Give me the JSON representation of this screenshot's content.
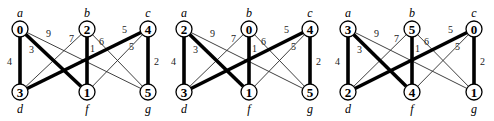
{
  "colors": {
    "background": "#ffffff",
    "edge": "#000000",
    "node_fill": "#ffffff"
  },
  "edges": [
    {
      "from": "a",
      "to": "d",
      "weight": "4",
      "thick": true,
      "label_offset": [
        -9,
        0
      ]
    },
    {
      "from": "a",
      "to": "f",
      "weight": "3",
      "thick": true,
      "label_offset": [
        -20,
        -16
      ]
    },
    {
      "from": "a",
      "to": "g",
      "weight": "9",
      "thick": false,
      "label_offset": [
        -40,
        -23
      ]
    },
    {
      "from": "b",
      "to": "d",
      "weight": "7",
      "thick": false,
      "label_offset": [
        25,
        -20
      ]
    },
    {
      "from": "b",
      "to": "f",
      "weight": "1",
      "thick": true,
      "label_offset": [
        5,
        -12
      ]
    },
    {
      "from": "b",
      "to": "g",
      "weight": "6",
      "thick": false,
      "label_offset": [
        -21,
        -22
      ]
    },
    {
      "from": "c",
      "to": "d",
      "weight": "5",
      "thick": true,
      "label_offset": [
        27,
        -26
      ]
    },
    {
      "from": "c",
      "to": "f",
      "weight": "5",
      "thick": false,
      "label_offset": [
        18,
        -13
      ]
    },
    {
      "from": "c",
      "to": "g",
      "weight": "2",
      "thick": true,
      "label_offset": [
        8,
        0
      ]
    }
  ],
  "graphs": [
    {
      "id": "graph-1",
      "positions": {
        "a": [
          20,
          29
        ],
        "b": [
          87,
          29
        ],
        "c": [
          148,
          29
        ],
        "d": [
          20,
          92
        ],
        "f": [
          87,
          92
        ],
        "g": [
          148,
          92
        ]
      },
      "numbers": {
        "a": "0",
        "b": "2",
        "c": "4",
        "d": "3",
        "f": "1",
        "g": "5"
      }
    },
    {
      "id": "graph-2",
      "positions": {
        "a": [
          184,
          29
        ],
        "b": [
          249,
          29
        ],
        "c": [
          310,
          29
        ],
        "d": [
          184,
          92
        ],
        "f": [
          249,
          92
        ],
        "g": [
          310,
          92
        ]
      },
      "numbers": {
        "a": "2",
        "b": "0",
        "c": "4",
        "d": "3",
        "f": "1",
        "g": "5"
      }
    },
    {
      "id": "graph-3",
      "positions": {
        "a": [
          348,
          29
        ],
        "b": [
          412,
          29
        ],
        "c": [
          474,
          29
        ],
        "d": [
          348,
          92
        ],
        "f": [
          412,
          92
        ],
        "g": [
          474,
          92
        ]
      },
      "numbers": {
        "a": "3",
        "b": "5",
        "c": "0",
        "d": "2",
        "f": "4",
        "g": "1"
      }
    }
  ],
  "node_names": {
    "a": "a",
    "b": "b",
    "c": "c",
    "d": "d",
    "f": "f",
    "g": "g"
  },
  "top_nodes": [
    "a",
    "b",
    "c"
  ],
  "bottom_nodes": [
    "d",
    "f",
    "g"
  ]
}
